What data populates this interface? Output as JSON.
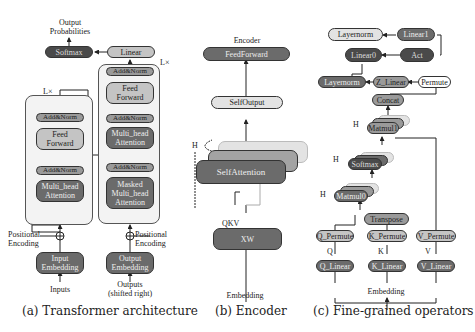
{
  "panel_a": {
    "caption": "(a) Transformer architecture",
    "output_label": "Output\nProbabilities",
    "softmax": "Softmax",
    "linear": "Linear",
    "encoder_repeat": "L×",
    "decoder_repeat": "L×",
    "encoder": {
      "add_norm_top": "Add&Norm",
      "feed_forward": "Feed\nForward",
      "add_norm_bottom": "Add&Norm",
      "attention": "Multi_head\nAttention"
    },
    "decoder": {
      "add_norm_top": "Add&Norm",
      "feed_forward": "Feed\nForward",
      "add_norm_mid": "Add&Norm",
      "attention": "Multi_head\nAttention",
      "add_norm_bottom": "Add&Norm",
      "masked_attention": "Masked\nMulti_head\nAttention"
    },
    "positional_encoding_left": "Positional\nEncoding",
    "positional_encoding_right": "Positional\nEncoding",
    "input_embedding": "Input\nEmbedding",
    "output_embedding": "Output\nEmbedding",
    "inputs": "Inputs",
    "outputs": "Outputs\n(shifted right)"
  },
  "panel_b": {
    "caption": "(b) Encoder",
    "title": "Encoder",
    "feed_forward": "FeedForward",
    "self_output": "SelfOutput",
    "heads_label": "H",
    "self_attention": "SelfAttention",
    "qkv_label": "QKV",
    "xw": "XW",
    "embedding": "Embedding"
  },
  "panel_c": {
    "caption": "(c) Fine-grained operators",
    "layernorm_top": "Layernorm",
    "linear1": "Linear1",
    "linear0": "Linear0",
    "act": "Act",
    "layernorm_mid": "Layernorm",
    "z_linear": "Z_Linear",
    "permute": "Permute",
    "concat": "Concat",
    "matmul1": "Matmul1",
    "softmax": "Softmax",
    "matmul0": "Matmul0",
    "transpose": "Transpose",
    "q_permute": "Q_Permute",
    "k_permute": "K_Permute",
    "v_permute": "V_Permute",
    "q_label": "Q",
    "k_label": "K",
    "v_label": "V",
    "q_linear": "Q_Linear",
    "k_linear": "K_Linear",
    "v_linear": "V_Linear",
    "embedding": "Embedding",
    "heads_label_1": "H",
    "heads_label_2": "H",
    "heads_label_3": "H"
  }
}
